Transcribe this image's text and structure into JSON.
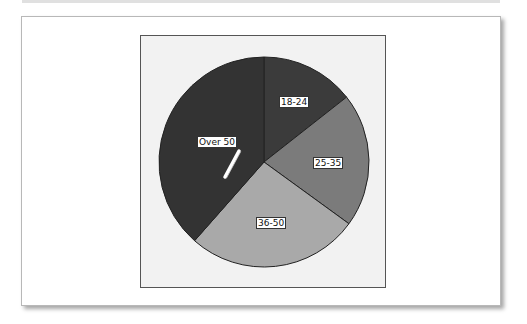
{
  "chart_data": {
    "type": "pie",
    "title": "",
    "categories": [
      "18-24",
      "25-35",
      "36-50",
      "Over 50"
    ],
    "values": [
      14.4,
      20.6,
      26.5,
      38.5
    ],
    "unit": "percent (estimated from slice angles)",
    "start_angle_deg": 0,
    "direction": "clockwise",
    "colors": [
      "#3b3b3b",
      "#7b7b7b",
      "#a9a9a9",
      "#333333"
    ],
    "legend": null
  },
  "labels": {
    "slice_1": "18-24",
    "slice_2": "25-35",
    "slice_3": "36-50",
    "slice_4": "Over 50"
  },
  "annotations": {
    "cursor_mark": "white diagonal pen stroke over Over 50 slice"
  },
  "colors": {
    "frame_background": "#f2f2f2",
    "frame_border": "#555555",
    "card_background": "#ffffff",
    "slice_outline": "#222222"
  }
}
